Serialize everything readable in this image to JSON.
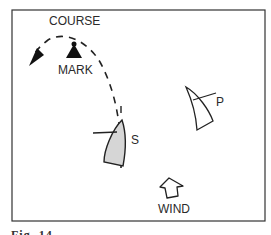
{
  "diagram": {
    "labels": {
      "course": "COURSE",
      "mark": "MARK",
      "boat_s": "S",
      "boat_p": "P",
      "wind": "WIND"
    },
    "caption": "Fig. 14"
  }
}
